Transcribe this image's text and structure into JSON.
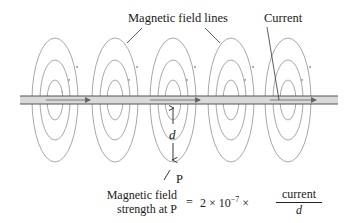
{
  "labels": {
    "field_lines": "Magnetic field lines",
    "current": "Current",
    "distance": "d",
    "point": "P"
  },
  "formula": {
    "lhs_line1": "Magnetic field",
    "lhs_line2": "strength at P",
    "equals": "=",
    "constant": "2 × 10",
    "exponent": "−7",
    "times": "×",
    "numerator": "current",
    "denominator": "d"
  },
  "colors": {
    "field_line": "#a8a8a8",
    "wire_fill": "#d9d9d9",
    "wire_edge": "#555555",
    "arrow": "#777777",
    "text": "#1a1a1a"
  },
  "loops": {
    "centers_x": [
      55,
      115,
      173,
      231,
      288
    ],
    "wire_y": 100,
    "count_per_group": 3
  }
}
